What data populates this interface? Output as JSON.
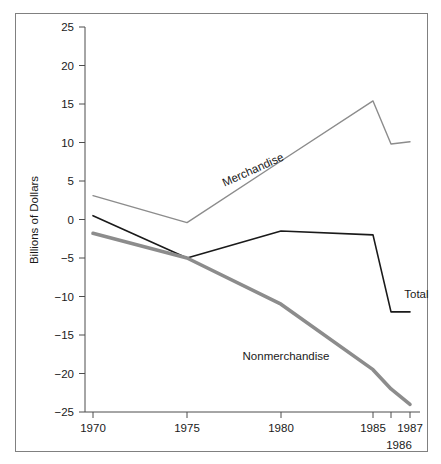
{
  "figure": {
    "background_color": "#ffffff",
    "frame_color": "#808080",
    "axis_color": "#4d4d4d"
  },
  "chart_data": {
    "type": "line",
    "title": "",
    "xlabel": "",
    "ylabel": "Billions of Dollars",
    "xlim": [
      1970,
      1987
    ],
    "ylim": [
      -25,
      25
    ],
    "grid": false,
    "legend": "inline-labels",
    "x_ticks": [
      1970,
      1975,
      1980,
      1985,
      1986,
      1987
    ],
    "x_tick_labels": [
      "1970",
      "1975",
      "1980",
      "1985",
      "1987",
      "1986"
    ],
    "y_ticks": [
      25,
      20,
      15,
      10,
      5,
      0,
      -5,
      -10,
      -15,
      -20,
      -25
    ],
    "y_tick_labels": [
      "25",
      "20",
      "15",
      "10",
      "5",
      "0",
      "−5",
      "−10",
      "−15",
      "−20",
      "−25"
    ],
    "x": [
      1970,
      1975,
      1980,
      1985,
      1986,
      1987
    ],
    "series": [
      {
        "name": "Merchandise",
        "label": "Merchandise",
        "color": "#8c8c8c",
        "width": 1.4,
        "values": [
          3.1,
          -0.4,
          7.6,
          15.4,
          9.8,
          10.1
        ]
      },
      {
        "name": "Total",
        "label": "Total",
        "color": "#1a1a1a",
        "width": 1.6,
        "values": [
          0.5,
          -5.0,
          -1.5,
          -2.0,
          -12.0,
          -12.0
        ]
      },
      {
        "name": "Nonmerchandise",
        "label": "Nonmerchandise",
        "color": "#8c8c8c",
        "width": 3.6,
        "values": [
          -1.8,
          -5.0,
          -11.0,
          -19.5,
          -22.0,
          -24.0
        ]
      }
    ],
    "annotations": [
      {
        "text": "Merchandise",
        "x": 1978.6,
        "y": 6.0,
        "rotation": -24
      },
      {
        "text": "Nonmerchandise",
        "x": 1980.2,
        "y": -18.2,
        "rotation": 0
      },
      {
        "text": "Total",
        "x": 1986.2,
        "y": -10.2,
        "rotation": 0
      }
    ]
  }
}
